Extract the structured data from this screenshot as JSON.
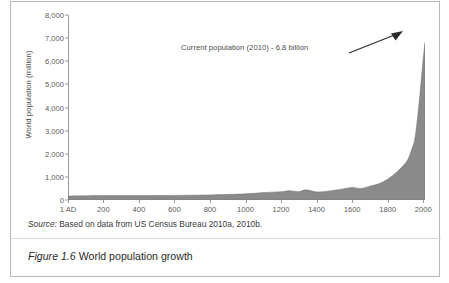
{
  "figure": {
    "caption_number": "Figure 1.6",
    "caption_text": "World population growth",
    "source_label": "Source:",
    "source_text": "Based on data from US Census Bureau 2010a, 2010b."
  },
  "colors": {
    "area_fill": "#8a8a8a",
    "axis": "#9a9a9a",
    "text": "#4a4a4a",
    "frame": "#b8b8b8"
  },
  "chart_data": {
    "type": "area",
    "title": "",
    "xlabel": "",
    "ylabel": "World population (million)",
    "xlim": [
      1,
      2010
    ],
    "ylim": [
      0,
      8000
    ],
    "grid": false,
    "legend": "none",
    "y_ticks": [
      0,
      1000,
      2000,
      3000,
      4000,
      5000,
      6000,
      7000,
      8000
    ],
    "y_tick_labels": [
      "0",
      "1,000",
      "2,000",
      "3,000",
      "4,000",
      "5,000",
      "6,000",
      "7,000",
      "8,000"
    ],
    "x_ticks": [
      1,
      200,
      400,
      600,
      800,
      1000,
      1200,
      1400,
      1600,
      1800,
      2000
    ],
    "x_tick_labels": [
      "1 AD",
      "200",
      "400",
      "600",
      "800",
      "1000",
      "1200",
      "1400",
      "1600",
      "1800",
      "2000"
    ],
    "annotations": [
      {
        "text": "Current population (2010) - 6.8 billion",
        "points_to_x": 2010,
        "points_to_y": 6800
      }
    ],
    "x": [
      1,
      200,
      400,
      600,
      800,
      1000,
      1100,
      1200,
      1250,
      1300,
      1340,
      1400,
      1450,
      1500,
      1550,
      1600,
      1650,
      1700,
      1750,
      1800,
      1850,
      1900,
      1920,
      1940,
      1950,
      1960,
      1970,
      1980,
      1990,
      2000,
      2010
    ],
    "y": [
      170,
      190,
      190,
      200,
      220,
      265,
      320,
      360,
      400,
      360,
      440,
      350,
      370,
      425,
      480,
      545,
      500,
      600,
      700,
      900,
      1200,
      1600,
      1860,
      2300,
      2530,
      3030,
      3700,
      4450,
      5300,
      6100,
      6800
    ]
  }
}
